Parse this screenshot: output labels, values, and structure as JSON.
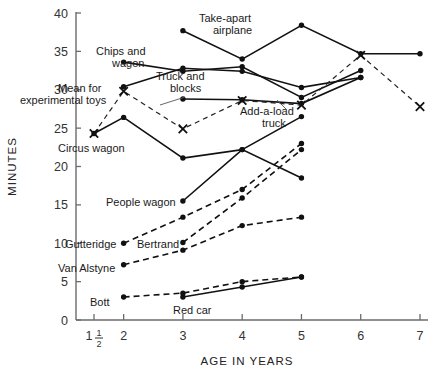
{
  "chart_data": {
    "type": "line",
    "title": "",
    "xlabel": "AGE IN YEARS",
    "ylabel": "MINUTES",
    "xlim": [
      1.0,
      7.0
    ],
    "ylim": [
      0,
      40
    ],
    "x_ticks": [
      1.5,
      2,
      3,
      4,
      5,
      6,
      7
    ],
    "x_tick_labels": [
      "1 1/2",
      "2",
      "3",
      "4",
      "5",
      "6",
      "7"
    ],
    "y_ticks": [
      0,
      5,
      10,
      15,
      20,
      25,
      30,
      35,
      40
    ],
    "y_tick_labels": [
      "0",
      "5",
      "10",
      "15",
      "20",
      "25",
      "30",
      "35",
      "40"
    ],
    "grid": false,
    "legend": "inline-annotations",
    "series": [
      {
        "name": "Take-apart airplane",
        "style": "solid",
        "marker": "dot",
        "x": [
          3,
          4,
          5,
          6,
          7
        ],
        "values": [
          37.7,
          34.0,
          38.4,
          34.7,
          34.7
        ]
      },
      {
        "name": "Chips and wagon",
        "style": "solid",
        "marker": "dot",
        "x": [
          2,
          3,
          4,
          5,
          6
        ],
        "values": [
          33.6,
          32.4,
          33.0,
          29.0,
          32.5
        ]
      },
      {
        "name": "Truck and blocks",
        "style": "solid",
        "marker": "dot",
        "x": [
          2,
          3,
          4,
          5,
          6
        ],
        "values": [
          30.4,
          32.8,
          32.4,
          30.3,
          31.6
        ]
      },
      {
        "name": "Add-a-load truck",
        "style": "solid",
        "marker": "dot",
        "x": [
          3,
          4,
          5,
          6
        ],
        "values": [
          28.8,
          28.7,
          28.2,
          31.6
        ]
      },
      {
        "name": "Circus wagon",
        "style": "solid",
        "marker": "dot",
        "x": [
          1.5,
          2,
          3,
          4,
          5
        ],
        "values": [
          24.3,
          26.4,
          21.1,
          22.2,
          18.5
        ]
      },
      {
        "name": "Mean for experimental toys",
        "style": "dashed",
        "marker": "cross",
        "x": [
          1.5,
          2,
          3,
          4,
          5,
          6,
          7
        ],
        "values": [
          24.3,
          29.8,
          24.9,
          28.6,
          28.0,
          34.5,
          27.8
        ]
      },
      {
        "name": "People wagon",
        "style": "solid",
        "marker": "dot",
        "x": [
          3,
          4,
          5
        ],
        "values": [
          15.5,
          22.2,
          26.5
        ]
      },
      {
        "name": "Gutteridge",
        "style": "dashed",
        "marker": "dot",
        "x": [
          2,
          3,
          4,
          5
        ],
        "values": [
          10.0,
          13.4,
          17.0,
          23.0
        ]
      },
      {
        "name": "Bertrand",
        "style": "dashed",
        "marker": "dot",
        "x": [
          3,
          4,
          5
        ],
        "values": [
          10.1,
          15.9,
          22.2
        ]
      },
      {
        "name": "Van Alstyne",
        "style": "dashed",
        "marker": "dot",
        "x": [
          2,
          3,
          4,
          5
        ],
        "values": [
          7.2,
          9.1,
          12.3,
          13.4
        ]
      },
      {
        "name": "Bott",
        "style": "dashed",
        "marker": "dot",
        "x": [
          2,
          3,
          4,
          5
        ],
        "values": [
          3.0,
          3.5,
          5.0,
          5.6
        ]
      },
      {
        "name": "Red car",
        "style": "solid",
        "marker": "dot",
        "x": [
          3,
          4,
          5
        ],
        "values": [
          3.0,
          4.3,
          5.6
        ]
      }
    ],
    "annotations": [
      {
        "text": "Take-apart",
        "x_px": 199,
        "y_px": 22
      },
      {
        "text": "airplane",
        "x_px": 213,
        "y_px": 34
      },
      {
        "text": "Chips and",
        "x_px": 96,
        "y_px": 55
      },
      {
        "text": "wagon",
        "x_px": 112,
        "y_px": 67
      },
      {
        "text": "Truck and",
        "x_px": 156,
        "y_px": 80
      },
      {
        "text": "blocks",
        "x_px": 170,
        "y_px": 92
      },
      {
        "text": "Mean for",
        "x_px": 58,
        "y_px": 92
      },
      {
        "text": "experimental toys",
        "x_px": 20,
        "y_px": 104
      },
      {
        "text": "Add-a-load",
        "x_px": 240,
        "y_px": 115
      },
      {
        "text": "truck",
        "x_px": 262,
        "y_px": 127
      },
      {
        "text": "Circus wagon",
        "x_px": 58,
        "y_px": 152
      },
      {
        "text": "People wagon",
        "x_px": 106,
        "y_px": 206
      },
      {
        "text": "Gutteridge",
        "x_px": 65,
        "y_px": 248
      },
      {
        "text": "Bertrand",
        "x_px": 137,
        "y_px": 248
      },
      {
        "text": "Van Alstyne",
        "x_px": 58,
        "y_px": 272
      },
      {
        "text": "Bott",
        "x_px": 90,
        "y_px": 306
      },
      {
        "text": "Red car",
        "x_px": 173,
        "y_px": 314
      }
    ],
    "colors": {
      "line": "#111111",
      "axis": "#6b6b6b",
      "text": "#1a1a1a"
    }
  }
}
